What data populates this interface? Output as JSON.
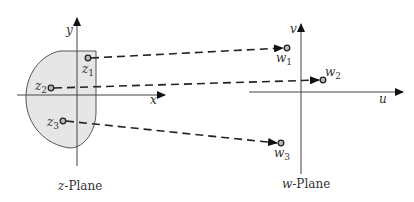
{
  "z_plane": {
    "title_var": "z",
    "title_rest": "-Plane",
    "x_axis_label": "x",
    "y_axis_label": "y",
    "region_fill": "#e6e6e6",
    "points": [
      {
        "var": "z",
        "sub": "1"
      },
      {
        "var": "z",
        "sub": "2"
      },
      {
        "var": "z",
        "sub": "3"
      }
    ]
  },
  "w_plane": {
    "title_var": "w",
    "title_rest": "-Plane",
    "u_axis_label": "u",
    "v_axis_label": "v",
    "points": [
      {
        "var": "w",
        "sub": "1"
      },
      {
        "var": "w",
        "sub": "2"
      },
      {
        "var": "w",
        "sub": "3"
      }
    ]
  },
  "mappings": [
    {
      "from": "z1",
      "to": "w1"
    },
    {
      "from": "z2",
      "to": "w2"
    },
    {
      "from": "z3",
      "to": "w3"
    }
  ],
  "colors": {
    "line": "#222222",
    "axis": "#444444",
    "point_fill": "#bbbbbb"
  }
}
